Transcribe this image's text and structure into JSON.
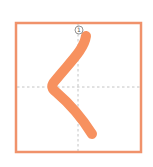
{
  "diagram": {
    "character": "く",
    "stroke_count": 1,
    "strokes": [
      {
        "order": 1,
        "label": "①"
      }
    ],
    "colors": {
      "border": "#f0926b",
      "stroke": "#f7915f",
      "guide": "#b5b5b5",
      "marker_text": "#555555"
    }
  }
}
